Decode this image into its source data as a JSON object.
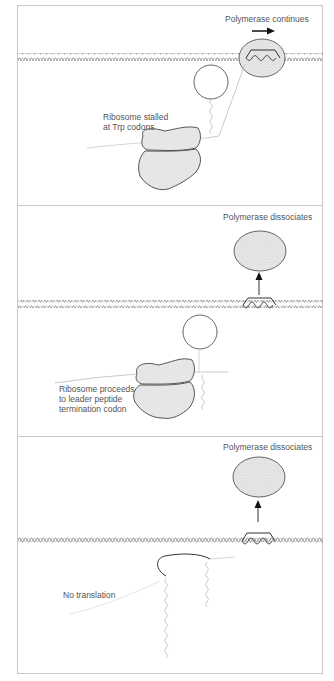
{
  "figure": {
    "type": "attenuation-mechanism-diagram",
    "panels": [
      {
        "id": "panel-1",
        "polymerase_label": "Polymerase continues",
        "ribosome_label_line1": "Ribosome stalled",
        "ribosome_label_line2": "at Trp codons",
        "polymerase_state": "continues",
        "arrow_direction": "right"
      },
      {
        "id": "panel-2",
        "polymerase_label": "Polymerase dissociates",
        "ribosome_label_line1": "Ribosome proceeds",
        "ribosome_label_line2": "to leader peptide",
        "ribosome_label_line3": "termination codon",
        "polymerase_state": "dissociates",
        "arrow_direction": "up"
      },
      {
        "id": "panel-3",
        "polymerase_label": "Polymerase dissociates",
        "translation_label": "No translation",
        "polymerase_state": "dissociates",
        "arrow_direction": "up"
      }
    ],
    "colors": {
      "line": "#444444",
      "dna": "#666666",
      "rna": "#bbbbbb",
      "shape_fill": "#e4e4e4",
      "frame": "#c8c8c8",
      "text": "#555555"
    }
  }
}
